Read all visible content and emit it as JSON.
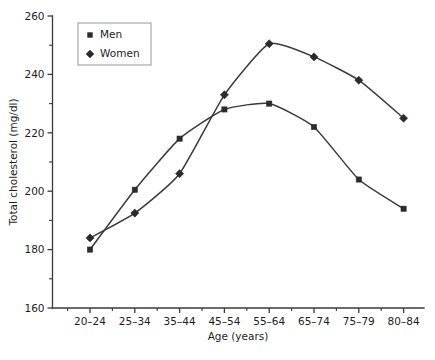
{
  "chart_data": {
    "type": "line",
    "title": "",
    "subtitle": "",
    "xlabel": "Age (years)",
    "ylabel": "Total cholesterol (mg/dl)",
    "categories": [
      "20–24",
      "25–34",
      "35–44",
      "45–54",
      "55–64",
      "65–74",
      "75–79",
      "80–84"
    ],
    "series": [
      {
        "name": "Men",
        "marker": "square",
        "color": "#2b2b2b",
        "values": [
          180,
          200.5,
          218,
          228,
          230,
          222,
          204,
          194
        ]
      },
      {
        "name": "Women",
        "marker": "diamond",
        "color": "#2b2b2b",
        "values": [
          184,
          192.5,
          206,
          233,
          250.5,
          246,
          238,
          225
        ]
      }
    ],
    "ylim": [
      160,
      260
    ],
    "ytick_labels": [
      "160",
      "180",
      "200",
      "220",
      "240",
      "260"
    ],
    "ytick_values": [
      160,
      180,
      200,
      220,
      240,
      260
    ],
    "yminor_values": [
      170,
      190,
      210,
      230,
      250
    ],
    "grid": false,
    "legend_position": "top-left",
    "legend_entries": [
      "Men",
      "Women"
    ],
    "interpolation": "smooth"
  },
  "axes": {
    "y_title": "Total cholesterol (mg/dl)",
    "x_title": "Age (years)"
  },
  "legend": {
    "items": [
      {
        "label": "Men",
        "marker": "square"
      },
      {
        "label": "Women",
        "marker": "diamond"
      }
    ]
  }
}
